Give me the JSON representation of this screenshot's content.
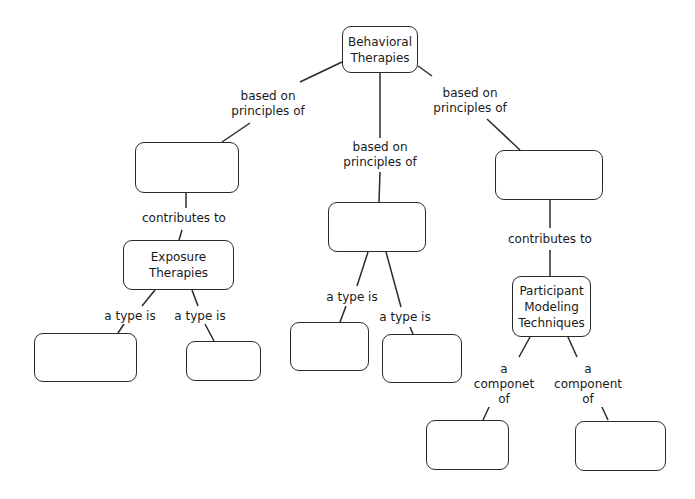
{
  "diagram": {
    "type": "concept-map",
    "nodes": [
      {
        "id": "root",
        "label": "Behavioral\nTherapies",
        "x": 342,
        "y": 26,
        "w": 76,
        "h": 47
      },
      {
        "id": "left",
        "label": "",
        "x": 135,
        "y": 142,
        "w": 104,
        "h": 51
      },
      {
        "id": "mid",
        "label": "",
        "x": 328,
        "y": 202,
        "w": 98,
        "h": 50
      },
      {
        "id": "right",
        "label": "",
        "x": 495,
        "y": 150,
        "w": 108,
        "h": 50
      },
      {
        "id": "exposure",
        "label": "Exposure\nTherapies",
        "x": 123,
        "y": 240,
        "w": 111,
        "h": 50
      },
      {
        "id": "exp_a",
        "label": "",
        "x": 34,
        "y": 333,
        "w": 103,
        "h": 49
      },
      {
        "id": "exp_b",
        "label": "",
        "x": 186,
        "y": 341,
        "w": 75,
        "h": 40
      },
      {
        "id": "mid_a",
        "label": "",
        "x": 290,
        "y": 322,
        "w": 79,
        "h": 49
      },
      {
        "id": "mid_b",
        "label": "",
        "x": 382,
        "y": 334,
        "w": 80,
        "h": 49
      },
      {
        "id": "participant",
        "label": "Participant\nModeling\nTechniques",
        "x": 512,
        "y": 276,
        "w": 79,
        "h": 61
      },
      {
        "id": "part_a",
        "label": "",
        "x": 426,
        "y": 420,
        "w": 83,
        "h": 50
      },
      {
        "id": "part_b",
        "label": "",
        "x": 575,
        "y": 421,
        "w": 91,
        "h": 50
      }
    ],
    "links": [
      {
        "label": "based on\nprinciples of",
        "lx": 268,
        "ly": 89,
        "path": [
          [
            342,
            62
          ],
          [
            300,
            82
          ]
        ],
        "path2": [
          [
            250,
            123
          ],
          [
            222,
            142
          ]
        ]
      },
      {
        "label": "based on\nprinciples of",
        "lx": 380,
        "ly": 140,
        "path": [
          [
            380,
            73
          ],
          [
            380,
            138
          ]
        ],
        "path2": [
          [
            380,
            172
          ],
          [
            379,
            202
          ]
        ]
      },
      {
        "label": "based on\nprinciples of",
        "lx": 470,
        "ly": 86,
        "path": [
          [
            418,
            66
          ],
          [
            432,
            76
          ]
        ],
        "path2": [
          [
            487,
            119
          ],
          [
            520,
            150
          ]
        ]
      },
      {
        "label": "contributes to",
        "lx": 184,
        "ly": 211,
        "path": [
          [
            186,
            193
          ],
          [
            186,
            208
          ]
        ],
        "path2": [
          [
            182,
            230
          ],
          [
            179,
            240
          ]
        ]
      },
      {
        "label": "contributes to",
        "lx": 550,
        "ly": 232,
        "path": [
          [
            550,
            200
          ],
          [
            550,
            228
          ]
        ],
        "path2": [
          [
            550,
            250
          ],
          [
            550,
            276
          ]
        ]
      },
      {
        "label": "a type is",
        "lx": 130,
        "ly": 309,
        "path": [
          [
            155,
            290
          ],
          [
            142,
            306
          ]
        ],
        "path2": [
          [
            124,
            324
          ],
          [
            118,
            333
          ]
        ]
      },
      {
        "label": "a type is",
        "lx": 200,
        "ly": 309,
        "path": [
          [
            192,
            290
          ],
          [
            198,
            306
          ]
        ],
        "path2": [
          [
            205,
            324
          ],
          [
            214,
            341
          ]
        ]
      },
      {
        "label": "a type is",
        "lx": 352,
        "ly": 290,
        "path": [
          [
            368,
            252
          ],
          [
            357,
            286
          ]
        ],
        "path2": [
          [
            346,
            306
          ],
          [
            340,
            322
          ]
        ]
      },
      {
        "label": "a type is",
        "lx": 405,
        "ly": 310,
        "path": [
          [
            386,
            252
          ],
          [
            401,
            307
          ]
        ],
        "path2": [
          [
            410,
            327
          ],
          [
            413,
            334
          ]
        ]
      },
      {
        "label": "a\ncomponet\nof",
        "lx": 504,
        "ly": 362,
        "path": [
          [
            530,
            337
          ],
          [
            519,
            357
          ]
        ],
        "path2": [
          [
            490,
            405
          ],
          [
            483,
            420
          ]
        ]
      },
      {
        "label": "a\ncomponent\nof",
        "lx": 588,
        "ly": 362,
        "path": [
          [
            568,
            337
          ],
          [
            577,
            357
          ]
        ],
        "path2": [
          [
            601,
            405
          ],
          [
            608,
            420
          ]
        ]
      }
    ]
  }
}
